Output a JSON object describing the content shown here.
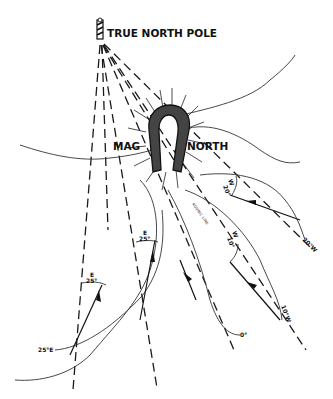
{
  "labels": {
    "true_north": "TRUE NORTH POLE",
    "mag": "MAG",
    "north": "NORTH",
    "agonic": "AGONIC LINE"
  },
  "isogonic_lines": [
    {
      "label": "25°E"
    },
    {
      "label": "0°"
    },
    {
      "label": "10°W"
    },
    {
      "label": "20°W"
    }
  ],
  "declination_marks": [
    {
      "dir": "E",
      "value": "25°"
    },
    {
      "dir": "E",
      "value": "25°"
    },
    {
      "dir": "W",
      "value": "10°"
    },
    {
      "dir": "W",
      "value": "20°"
    }
  ],
  "colors": {
    "ink": "#111111",
    "background": "#ffffff"
  }
}
